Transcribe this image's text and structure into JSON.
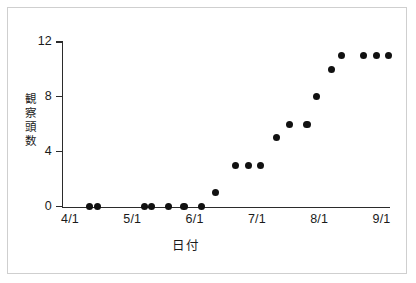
{
  "chart_data": {
    "type": "scatter",
    "title": "",
    "xlabel": "日付",
    "ylabel": "観察頭数",
    "ylim": [
      0,
      12
    ],
    "y_ticks": [
      0,
      4,
      8,
      12
    ],
    "y_tick_labels": [
      "0",
      "4",
      "8",
      "12"
    ],
    "x_ticks": [
      "4/1",
      "5/1",
      "6/1",
      "7/1",
      "8/1",
      "9/1"
    ],
    "x_tick_labels": [
      "4/1",
      "5/1",
      "6/1",
      "7/1",
      "8/1",
      "9/1"
    ],
    "grid": false,
    "legend": "none",
    "marker": {
      "shape": "circle",
      "color": "#111111",
      "size_px": 7
    },
    "series": [
      {
        "name": "観察頭数",
        "points": [
          {
            "date": "3/29",
            "x_frac": 0.063,
            "value": 0
          },
          {
            "date": "4/3",
            "x_frac": 0.088,
            "value": 0
          },
          {
            "date": "4/27",
            "x_frac": 0.238,
            "value": 0
          },
          {
            "date": "4/30",
            "x_frac": 0.262,
            "value": 0
          },
          {
            "date": "5/8",
            "x_frac": 0.315,
            "value": 0
          },
          {
            "date": "5/16",
            "x_frac": 0.366,
            "value": 0
          },
          {
            "date": "5/25",
            "x_frac": 0.421,
            "value": 0
          },
          {
            "date": "6/1",
            "x_frac": 0.468,
            "value": 1
          },
          {
            "date": "6/10",
            "x_frac": 0.53,
            "value": 3
          },
          {
            "date": "6/17",
            "x_frac": 0.572,
            "value": 3
          },
          {
            "date": "6/23",
            "x_frac": 0.612,
            "value": 3
          },
          {
            "date": "7/3",
            "x_frac": 0.662,
            "value": 5
          },
          {
            "date": "7/8",
            "x_frac": 0.705,
            "value": 6
          },
          {
            "date": "7/17",
            "x_frac": 0.761,
            "value": 6
          },
          {
            "date": "7/22",
            "x_frac": 0.792,
            "value": 8
          },
          {
            "date": "7/29",
            "x_frac": 0.839,
            "value": 10
          },
          {
            "date": "8/3",
            "x_frac": 0.871,
            "value": 11
          },
          {
            "date": "8/16",
            "x_frac": 0.942,
            "value": 11
          },
          {
            "date": "8/23",
            "x_frac": 0.985,
            "value": 11
          },
          {
            "date": "8/29",
            "x_frac": 1.023,
            "value": 11
          }
        ]
      }
    ]
  },
  "axes": {
    "y_title_chars": [
      "観",
      "察",
      "頭",
      "数"
    ],
    "y_labels": [
      {
        "text": "12",
        "value": 12
      },
      {
        "text": "8",
        "value": 8
      },
      {
        "text": "4",
        "value": 4
      },
      {
        "text": "0",
        "value": 0
      }
    ],
    "x_labels": [
      {
        "text": "4/1"
      },
      {
        "text": "5/1"
      },
      {
        "text": "6/1"
      },
      {
        "text": "7/1"
      },
      {
        "text": "8/1"
      },
      {
        "text": "9/1"
      }
    ],
    "x_title": "日付"
  },
  "colors": {
    "marker": "#111111",
    "axis": "#2b2b2b",
    "frame": "#cfcfcf",
    "background": "#ffffff",
    "text": "#1a1a1a"
  }
}
